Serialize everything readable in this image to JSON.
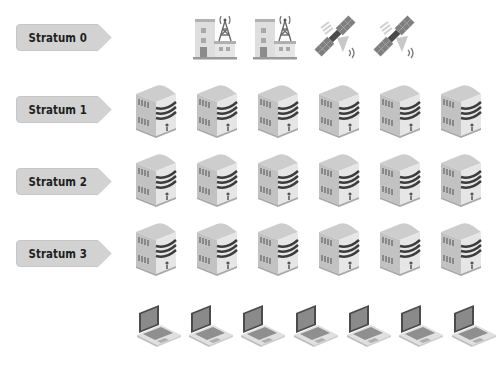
{
  "diagram": {
    "title": "",
    "strata": [
      {
        "label": "Stratum 0",
        "device": "reference-clock",
        "count": 4
      },
      {
        "label": "Stratum 1",
        "device": "server",
        "count": 6
      },
      {
        "label": "Stratum 2",
        "device": "server",
        "count": 6
      },
      {
        "label": "Stratum 3",
        "device": "server",
        "count": 6
      }
    ],
    "clients": {
      "device": "laptop",
      "count": 7
    },
    "stratum0_devices": [
      "radio-tower-building",
      "radio-tower-building",
      "gps-satellite",
      "gps-satellite"
    ],
    "colors": {
      "label_fill": "#d2d2d2",
      "label_text": "#1e1e1e",
      "icon_light": "#e4e4e4",
      "icon_mid": "#b9b9b9",
      "icon_dark": "#4a4a4a",
      "background": "#ffffff"
    }
  }
}
